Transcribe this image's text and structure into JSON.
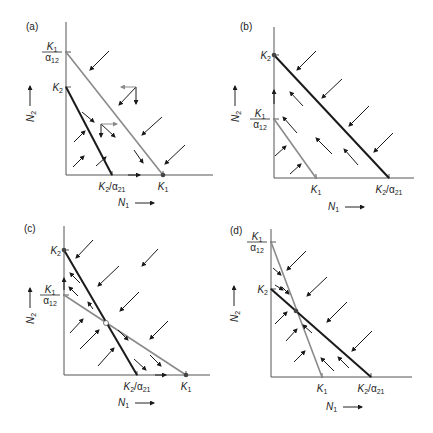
{
  "figure": {
    "colors": {
      "axis": "#555555",
      "isocline_n1": "#8a8a8a",
      "isocline_n2": "#1a1a1a",
      "arrow": "#1a1a1a",
      "gray_arrow": "#8a8a8a"
    },
    "panels": [
      {
        "id": "a",
        "label": "(a)",
        "label_pos": [
          26,
          30
        ],
        "origin": [
          66,
          175
        ],
        "x_end": 213,
        "y_top": 22,
        "x_axis_label": "N1",
        "y_axis_label": "N2",
        "n1_label_pos": [
          118,
          206
        ],
        "n2_label_pos": [
          30,
          100
        ],
        "y_ticks": [
          {
            "y": 52,
            "text": "K1/α12",
            "kind": "frac"
          },
          {
            "y": 87,
            "text": "K2",
            "kind": "k2"
          }
        ],
        "x_ticks": [
          {
            "x": 112,
            "text": "K2/α21",
            "kind": "ratio"
          },
          {
            "x": 163,
            "text": "K1",
            "kind": "k1"
          }
        ],
        "isoclines": [
          {
            "name": "N1 isocline",
            "from": [
              66,
              52
            ],
            "to": [
              163,
              175
            ],
            "color": "isocline_n1"
          },
          {
            "name": "N2 isocline",
            "from": [
              66,
              87
            ],
            "to": [
              112,
              175
            ],
            "color": "isocline_n2"
          }
        ],
        "equilibria": [
          {
            "x": 163,
            "y": 175,
            "type": "stable"
          }
        ],
        "arrows": [
          [
            109,
            51,
            90,
            70
          ],
          [
            162,
            117,
            142,
            135
          ],
          [
            185,
            145,
            165,
            164
          ],
          [
            82,
            112,
            94,
            122
          ],
          [
            134,
            150,
            143,
            163
          ],
          [
            74,
            142,
            85,
            131
          ],
          [
            73,
            167,
            84,
            156
          ],
          [
            96,
            166,
            106,
            157
          ],
          [
            136,
            87,
            119,
            105
          ],
          [
            136,
            87,
            136,
            104
          ],
          [
            136,
            87,
            121,
            87
          ],
          [
            101,
            124,
            101,
            137
          ],
          [
            101,
            124,
            115,
            137
          ],
          [
            101,
            124,
            117,
            124
          ],
          [
            128,
            175,
            140,
            175
          ]
        ],
        "gray_arrow_indices": [
          10,
          13
        ]
      },
      {
        "id": "b",
        "label": "(b)",
        "label_pos": [
          240,
          30
        ],
        "origin": [
          274,
          178
        ],
        "x_end": 414,
        "y_top": 27,
        "x_axis_label": "N1",
        "y_axis_label": "N2",
        "n1_label_pos": [
          328,
          210
        ],
        "n2_label_pos": [
          235,
          100
        ],
        "y_ticks": [
          {
            "y": 55,
            "text": "K2",
            "kind": "k2"
          },
          {
            "y": 119,
            "text": "K1/α12",
            "kind": "frac"
          }
        ],
        "x_ticks": [
          {
            "x": 316,
            "text": "K1",
            "kind": "k1"
          },
          {
            "x": 389,
            "text": "K2/α21",
            "kind": "ratio"
          }
        ],
        "isoclines": [
          {
            "name": "N1 isocline",
            "from": [
              274,
              119
            ],
            "to": [
              316,
              178
            ],
            "color": "isocline_n1"
          },
          {
            "name": "N2 isocline",
            "from": [
              274,
              55
            ],
            "to": [
              389,
              178
            ],
            "color": "isocline_n2"
          }
        ],
        "equilibria": [
          {
            "x": 274,
            "y": 55,
            "type": "stable"
          }
        ],
        "arrows": [
          [
            316,
            51,
            297,
            70
          ],
          [
            342,
            79,
            322,
            98
          ],
          [
            369,
            106,
            349,
            126
          ],
          [
            393,
            133,
            374,
            152
          ],
          [
            303,
            106,
            290,
            92
          ],
          [
            297,
            133,
            283,
            117
          ],
          [
            332,
            154,
            316,
            138
          ],
          [
            358,
            165,
            344,
            149
          ],
          [
            275,
            156,
            286,
            146
          ],
          [
            290,
            174,
            301,
            164
          ],
          [
            274,
            104,
            274,
            90
          ]
        ],
        "gray_arrow_indices": []
      },
      {
        "id": "c",
        "label": "(c)",
        "label_pos": [
          24,
          232
        ],
        "origin": [
          64,
          375
        ],
        "x_end": 210,
        "y_top": 226,
        "x_axis_label": "N1",
        "y_axis_label": "N2",
        "n1_label_pos": [
          118,
          406
        ],
        "n2_label_pos": [
          30,
          302
        ],
        "y_ticks": [
          {
            "y": 250,
            "text": "K2",
            "kind": "k2"
          },
          {
            "y": 295,
            "text": "K1/α12",
            "kind": "frac"
          }
        ],
        "x_ticks": [
          {
            "x": 137,
            "text": "K2/α21",
            "kind": "ratio"
          },
          {
            "x": 186,
            "text": "K1",
            "kind": "k1"
          }
        ],
        "isoclines": [
          {
            "name": "N1 isocline",
            "from": [
              64,
              295
            ],
            "to": [
              186,
              375
            ],
            "color": "isocline_n1"
          },
          {
            "name": "N2 isocline",
            "from": [
              64,
              250
            ],
            "to": [
              137,
              375
            ],
            "color": "isocline_n2"
          }
        ],
        "equilibria": [
          {
            "x": 64,
            "y": 250,
            "type": "stable"
          },
          {
            "x": 186,
            "y": 375,
            "type": "stable"
          },
          {
            "x": 106,
            "y": 323,
            "type": "unstable"
          }
        ],
        "arrows": [
          [
            93,
            240,
            76,
            258
          ],
          [
            158,
            249,
            142,
            266
          ],
          [
            119,
            266,
            98,
            286
          ],
          [
            139,
            292,
            120,
            311
          ],
          [
            168,
            321,
            150,
            339
          ],
          [
            80,
            283,
            70,
            273
          ],
          [
            78,
            296,
            69,
            287
          ],
          [
            93,
            309,
            88,
            302
          ],
          [
            70,
            333,
            83,
            319
          ],
          [
            80,
            349,
            99,
            330
          ],
          [
            98,
            366,
            114,
            348
          ],
          [
            118,
            330,
            128,
            340
          ],
          [
            134,
            359,
            146,
            370
          ],
          [
            150,
            355,
            161,
            366
          ],
          [
            155,
            375,
            166,
            375
          ],
          [
            64,
            290,
            64,
            278
          ]
        ],
        "gray_arrow_indices": []
      },
      {
        "id": "d",
        "label": "(d)",
        "label_pos": [
          230,
          234
        ],
        "origin": [
          271,
          377
        ],
        "x_end": 412,
        "y_top": 229,
        "x_axis_label": "N1",
        "y_axis_label": "N2",
        "n1_label_pos": [
          326,
          410
        ],
        "n2_label_pos": [
          234,
          300
        ],
        "y_ticks": [
          {
            "y": 242,
            "text": "K1/α12",
            "kind": "frac"
          },
          {
            "y": 289,
            "text": "K2",
            "kind": "k2"
          }
        ],
        "x_ticks": [
          {
            "x": 322,
            "text": "K1",
            "kind": "k1"
          },
          {
            "x": 371,
            "text": "K2/α21",
            "kind": "ratio"
          }
        ],
        "isoclines": [
          {
            "name": "N1 isocline",
            "from": [
              271,
              242
            ],
            "to": [
              322,
              377
            ],
            "color": "isocline_n1"
          },
          {
            "name": "N2 isocline",
            "from": [
              271,
              289
            ],
            "to": [
              371,
              377
            ],
            "color": "isocline_n2"
          }
        ],
        "equilibria": [
          {
            "x": 296,
            "y": 311,
            "type": "stable"
          }
        ],
        "arrows": [
          [
            306,
            251,
            287,
            270
          ],
          [
            327,
            277,
            307,
            296
          ],
          [
            347,
            302,
            327,
            322
          ],
          [
            372,
            331,
            352,
            351
          ],
          [
            273,
            268,
            281,
            275
          ],
          [
            282,
            287,
            289,
            294
          ],
          [
            275,
            285,
            283,
            290
          ],
          [
            275,
            324,
            287,
            312
          ],
          [
            286,
            341,
            297,
            329
          ],
          [
            294,
            362,
            305,
            351
          ],
          [
            312,
            333,
            303,
            325
          ],
          [
            334,
            371,
            321,
            358
          ],
          [
            349,
            368,
            338,
            357
          ]
        ],
        "gray_arrow_indices": []
      }
    ]
  }
}
